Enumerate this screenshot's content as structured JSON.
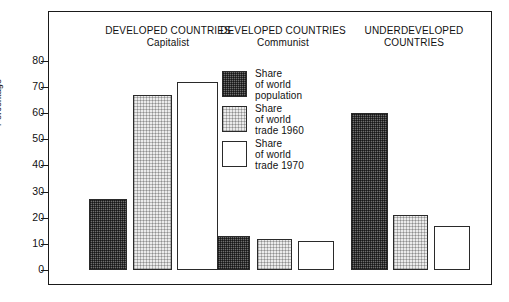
{
  "chart_data": {
    "type": "bar",
    "title": "",
    "xlabel": "",
    "ylabel": "Percentage",
    "ylim": [
      0,
      85
    ],
    "yticks": [
      0,
      10,
      20,
      30,
      40,
      50,
      60,
      70,
      80
    ],
    "grid": false,
    "legend_position": "inside-center",
    "categories": [
      "DEVELOPED COUNTRIES Capitalist",
      "DEVELOPED COUNTRIES Communist",
      "UNDERDEVELOPED COUNTRIES"
    ],
    "series": [
      {
        "name": "Share of world population",
        "values": [
          27,
          13,
          60
        ]
      },
      {
        "name": "Share of world trade 1960",
        "values": [
          67,
          12,
          21
        ]
      },
      {
        "name": "Share of world trade 1970",
        "values": [
          72,
          11,
          17
        ]
      }
    ]
  },
  "axis": {
    "y_title": "Percentage",
    "tick_labels": [
      "80",
      "70",
      "60",
      "50",
      "40",
      "30",
      "20",
      "10",
      "0"
    ]
  },
  "groups": [
    {
      "line1": "DEVELOPED COUNTRIES",
      "line2": "Capitalist"
    },
    {
      "line1": "DEVELOPED COUNTRIES",
      "line2": "Communist"
    },
    {
      "line1": "UNDERDEVELOPED",
      "line2": "COUNTRIES"
    }
  ],
  "legend": [
    {
      "label": "Share\nof world\npopulation",
      "fill": "dark",
      "color": "#6e6e6e"
    },
    {
      "label": "Share\nof world\ntrade 1960",
      "fill": "light",
      "color": "#ebebeb"
    },
    {
      "label": "Share\nof world\ntrade 1970",
      "fill": "white",
      "color": "#ffffff"
    }
  ]
}
